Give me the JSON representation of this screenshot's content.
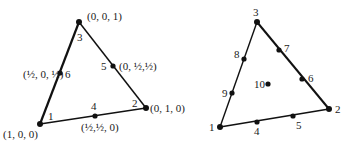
{
  "figure": {
    "left_triangle": {
      "description": "Quadratic triangular element (6 nodes) with area coordinates",
      "edge_widths": [
        2.2,
        1.4,
        1.4
      ],
      "nodes": [
        {
          "id": "1",
          "x": 40,
          "y": 124,
          "coord": "(1, 0, 0)"
        },
        {
          "id": "2",
          "x": 146,
          "y": 108,
          "coord": "(0, 1, 0)"
        },
        {
          "id": "3",
          "x": 79,
          "y": 22,
          "coord": "(0, 0, 1)"
        },
        {
          "id": "4",
          "x": 95,
          "y": 116,
          "coord": "(½,½, 0)"
        },
        {
          "id": "5",
          "x": 113,
          "y": 66,
          "coord": "(0, ½,½)"
        },
        {
          "id": "6",
          "x": 60,
          "y": 73,
          "coord": "(½, 0, ½)"
        }
      ]
    },
    "right_triangle": {
      "description": "Cubic triangular element (10 nodes)",
      "nodes": [
        {
          "id": "1",
          "x": 220,
          "y": 127
        },
        {
          "id": "2",
          "x": 329,
          "y": 109
        },
        {
          "id": "3",
          "x": 257,
          "y": 22
        },
        {
          "id": "4",
          "x": 257,
          "y": 122
        },
        {
          "id": "5",
          "x": 293,
          "y": 116
        },
        {
          "id": "6",
          "x": 302,
          "y": 79
        },
        {
          "id": "7",
          "x": 279,
          "y": 50
        },
        {
          "id": "8",
          "x": 244,
          "y": 59
        },
        {
          "id": "9",
          "x": 232,
          "y": 93
        },
        {
          "id": "10",
          "x": 268,
          "y": 84
        }
      ]
    }
  }
}
